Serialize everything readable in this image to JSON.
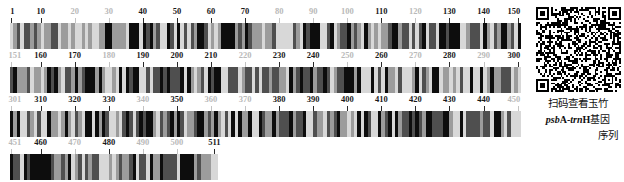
{
  "figure": {
    "type": "dna-barcode",
    "sequence_length": 511,
    "rows": [
      {
        "start": 1,
        "end": 150,
        "ticks": [
          {
            "value": 1,
            "label": "1",
            "style": "major"
          },
          {
            "value": 10,
            "label": "10",
            "style": "major"
          },
          {
            "value": 20,
            "label": "20",
            "style": "minor"
          },
          {
            "value": 30,
            "label": "30",
            "style": "minor"
          },
          {
            "value": 40,
            "label": "40",
            "style": "major"
          },
          {
            "value": 50,
            "label": "50",
            "style": "major"
          },
          {
            "value": 60,
            "label": "60",
            "style": "major"
          },
          {
            "value": 70,
            "label": "70",
            "style": "major"
          },
          {
            "value": 80,
            "label": "80",
            "style": "minor"
          },
          {
            "value": 90,
            "label": "90",
            "style": "minor"
          },
          {
            "value": 100,
            "label": "100",
            "style": "minor"
          },
          {
            "value": 110,
            "label": "110",
            "style": "major"
          },
          {
            "value": 120,
            "label": "120",
            "style": "minor"
          },
          {
            "value": 130,
            "label": "130",
            "style": "major"
          },
          {
            "value": 140,
            "label": "140",
            "style": "major"
          },
          {
            "value": 150,
            "label": "150",
            "style": "major"
          }
        ]
      },
      {
        "start": 151,
        "end": 300,
        "ticks": [
          {
            "value": 151,
            "label": "151",
            "style": "minor"
          },
          {
            "value": 160,
            "label": "160",
            "style": "major"
          },
          {
            "value": 170,
            "label": "170",
            "style": "major"
          },
          {
            "value": 180,
            "label": "180",
            "style": "minor"
          },
          {
            "value": 190,
            "label": "190",
            "style": "major"
          },
          {
            "value": 200,
            "label": "200",
            "style": "major"
          },
          {
            "value": 210,
            "label": "210",
            "style": "major"
          },
          {
            "value": 220,
            "label": "220",
            "style": "minor"
          },
          {
            "value": 230,
            "label": "230",
            "style": "major"
          },
          {
            "value": 240,
            "label": "240",
            "style": "major"
          },
          {
            "value": 250,
            "label": "250",
            "style": "minor"
          },
          {
            "value": 260,
            "label": "260",
            "style": "major"
          },
          {
            "value": 270,
            "label": "270",
            "style": "minor"
          },
          {
            "value": 280,
            "label": "280",
            "style": "major"
          },
          {
            "value": 290,
            "label": "290",
            "style": "minor"
          },
          {
            "value": 300,
            "label": "300",
            "style": "major"
          }
        ]
      },
      {
        "start": 301,
        "end": 450,
        "ticks": [
          {
            "value": 301,
            "label": "301",
            "style": "minor"
          },
          {
            "value": 310,
            "label": "310",
            "style": "major"
          },
          {
            "value": 320,
            "label": "320",
            "style": "major"
          },
          {
            "value": 330,
            "label": "330",
            "style": "major"
          },
          {
            "value": 340,
            "label": "340",
            "style": "minor"
          },
          {
            "value": 350,
            "label": "350",
            "style": "major"
          },
          {
            "value": 360,
            "label": "360",
            "style": "minor"
          },
          {
            "value": 370,
            "label": "370",
            "style": "minor"
          },
          {
            "value": 380,
            "label": "380",
            "style": "major"
          },
          {
            "value": 390,
            "label": "390",
            "style": "major"
          },
          {
            "value": 400,
            "label": "400",
            "style": "major"
          },
          {
            "value": 410,
            "label": "410",
            "style": "major"
          },
          {
            "value": 420,
            "label": "420",
            "style": "major"
          },
          {
            "value": 430,
            "label": "430",
            "style": "major"
          },
          {
            "value": 440,
            "label": "440",
            "style": "major"
          },
          {
            "value": 450,
            "label": "450",
            "style": "minor"
          }
        ]
      },
      {
        "start": 451,
        "end": 511,
        "ticks": [
          {
            "value": 451,
            "label": "451",
            "style": "minor"
          },
          {
            "value": 460,
            "label": "460",
            "style": "major"
          },
          {
            "value": 470,
            "label": "470",
            "style": "minor"
          },
          {
            "value": 480,
            "label": "480",
            "style": "major"
          },
          {
            "value": 490,
            "label": "490",
            "style": "minor"
          },
          {
            "value": 500,
            "label": "500",
            "style": "minor"
          },
          {
            "value": 511,
            "label": "511",
            "style": "major"
          }
        ]
      }
    ],
    "base_colors": {
      "A": "#0d0d0d",
      "T": "#4f4f4f",
      "G": "#9c9c9c",
      "C": "#d8d8d8"
    }
  },
  "qr": {
    "alt": "qr-code",
    "modules": 45
  },
  "caption": {
    "line1": "扫码查看玉竹",
    "line2_italic": "psb",
    "line2_roman_a": "A-",
    "line2_italic2": "trn",
    "line2_roman_h": "H",
    "line2_tail": "基因",
    "line3": "序列"
  }
}
